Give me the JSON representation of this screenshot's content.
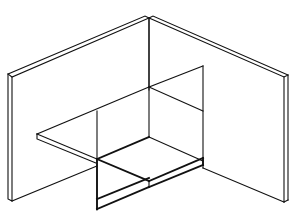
{
  "diagram": {
    "type": "isometric-line-drawing",
    "colors": {
      "background": "#ffffff",
      "line": "#111111"
    },
    "parts": [
      {
        "name": "left-wall-panel"
      },
      {
        "name": "right-wall-panel"
      },
      {
        "name": "corner-edge"
      },
      {
        "name": "horizontal-section-plane"
      },
      {
        "name": "floor-slab"
      }
    ]
  }
}
